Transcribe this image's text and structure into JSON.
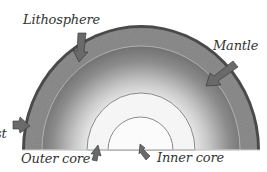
{
  "labels": {
    "lithosphere": "Lithosphere",
    "mantle": "Mantle",
    "crust": "Crust",
    "outer_core": "Outer core",
    "inner_core": "Inner core"
  },
  "colors": {
    "crust_dark": "#4a4a4a",
    "lithosphere_band": "#8a8a8a",
    "mantle_outer": "#6e6e6e",
    "mantle_inner": "#d8d8d8",
    "outer_core": "#f4f4f4",
    "inner_core": "#fafafa",
    "arrow": "#6a6a6a",
    "text": "#333333"
  }
}
